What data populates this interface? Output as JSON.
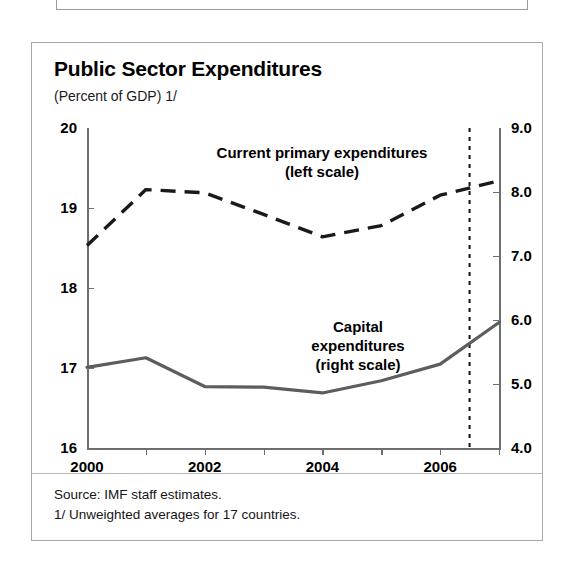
{
  "page": {
    "clipped_top_text": "                                                                            "
  },
  "figure": {
    "title": "Public Sector Expenditures",
    "subtitle": "(Percent of GDP) 1/",
    "annotations": {
      "current": "Current primary expenditures\n(left scale)",
      "capital": "Capital\nexpenditures\n(right scale)"
    },
    "footnotes": {
      "source": "Source: IMF staff estimates.",
      "note": "1/ Unweighted averages for 17 countries."
    }
  },
  "chart_data": {
    "type": "line",
    "title": "Public Sector Expenditures",
    "subtitle": "(Percent of GDP) 1/",
    "xlabel": "",
    "x": [
      2000,
      2001,
      2002,
      2003,
      2004,
      2005,
      2006,
      2007
    ],
    "x_tick_labels": [
      "2000",
      "",
      "2002",
      "",
      "2004",
      "",
      "2006",
      ""
    ],
    "x_ticks_all": [
      2000,
      2001,
      2002,
      2003,
      2004,
      2005,
      2006,
      2007
    ],
    "xlim": [
      2000,
      2007
    ],
    "grid": false,
    "legend": "inside-plot-annotations",
    "forecast_marker": {
      "label": "projection divider",
      "x": 2006.5,
      "style": "vertical dotted line"
    },
    "axes": [
      {
        "id": "left",
        "ylabel": "",
        "ylim": [
          16,
          20
        ],
        "ticks": [
          16,
          17,
          18,
          19,
          20
        ],
        "tick_labels": [
          "16",
          "17",
          "18",
          "19",
          "20"
        ]
      },
      {
        "id": "right",
        "ylabel": "",
        "ylim": [
          4.0,
          9.0
        ],
        "ticks": [
          4.0,
          5.0,
          6.0,
          7.0,
          8.0,
          9.0
        ],
        "tick_labels": [
          "4.0",
          "5.0",
          "6.0",
          "7.0",
          "8.0",
          "9.0"
        ]
      }
    ],
    "series": [
      {
        "name": "Current primary expenditures (left scale)",
        "axis": "left",
        "style": "dashed",
        "color": "#1a1a1a",
        "values": [
          18.53,
          19.23,
          19.19,
          18.92,
          18.64,
          18.78,
          19.16,
          19.34
        ]
      },
      {
        "name": "Capital expenditures (right scale)",
        "axis": "right",
        "style": "solid",
        "color": "#5d5d5d",
        "values": [
          5.26,
          5.41,
          4.96,
          4.95,
          4.86,
          5.05,
          5.31,
          5.96
        ]
      }
    ],
    "source": "Source: IMF staff estimates.",
    "note": "1/ Unweighted averages for 17 countries."
  }
}
